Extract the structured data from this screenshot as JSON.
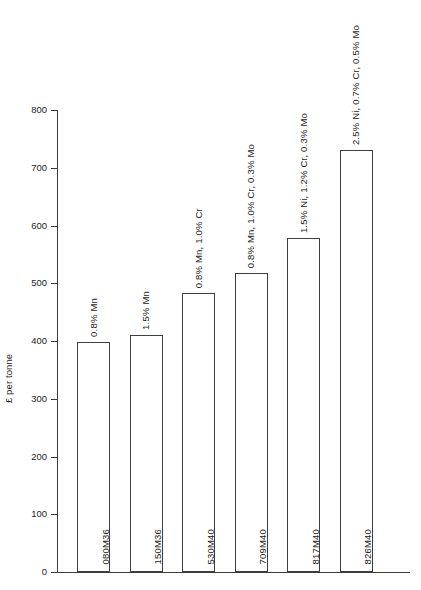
{
  "chart_data": {
    "type": "bar",
    "title": "",
    "xlabel": "",
    "ylabel": "£ per tonne",
    "ylim": [
      0,
      800
    ],
    "yticks": [
      0,
      100,
      200,
      300,
      400,
      500,
      600,
      700,
      800
    ],
    "ytick_labels": [
      "0",
      "100",
      "200",
      "300",
      "400",
      "500",
      "600",
      "700",
      "800"
    ],
    "grid": false,
    "legend": "none",
    "categories": [
      "080M36",
      "150M36",
      "530M40",
      "709M40",
      "817M40",
      "826M40"
    ],
    "values": [
      398,
      410,
      483,
      518,
      578,
      730
    ],
    "annotations": [
      "0.8% Mn",
      "1.5% Mn",
      "0.8% Mn, 1.0% Cr",
      "0.8% Mn, 1.0% Cr, 0.3% Mo",
      "1.5% Ni, 1.2% Cr, 0.3% Mo",
      "2.5% Ni, 0.7% Cr, 0.5% Mo"
    ],
    "bars": [
      {
        "category": "080M36",
        "value": 398,
        "annotation": "0.8% Mn"
      },
      {
        "category": "150M36",
        "value": 410,
        "annotation": "1.5% Mn"
      },
      {
        "category": "530M40",
        "value": 483,
        "annotation": "0.8% Mn, 1.0% Cr"
      },
      {
        "category": "709M40",
        "value": 518,
        "annotation": "0.8% Mn, 1.0% Cr, 0.3% Mo"
      },
      {
        "category": "817M40",
        "value": 578,
        "annotation": "1.5% Ni, 1.2% Cr, 0.3% Mo"
      },
      {
        "category": "826M40",
        "value": 730,
        "annotation": "2.5% Ni, 0.7% Cr, 0.5% Mo"
      }
    ],
    "colors": {
      "bar_fill": "#ffffff",
      "bar_stroke": "#3f3f3f",
      "axis": "#3c3c3c",
      "text": "#1c1c1c",
      "background": "#ffffff"
    }
  }
}
